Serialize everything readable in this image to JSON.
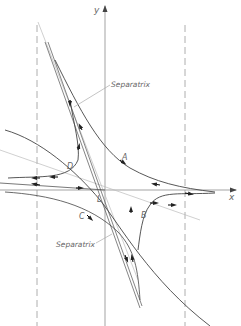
{
  "diagram": {
    "type": "phase-portrait",
    "axes": {
      "x_label": "x",
      "y_label": "y"
    },
    "critical_point": {
      "label": "L",
      "kind": "saddle"
    },
    "separatrix_labels": [
      "Separatrix",
      "Separatrix"
    ],
    "trajectory_labels": [
      "A",
      "B",
      "C",
      "D"
    ],
    "colors": {
      "line": "#555555",
      "axis": "#999999",
      "light": "#bbbbbb",
      "background": "#ffffff"
    }
  }
}
